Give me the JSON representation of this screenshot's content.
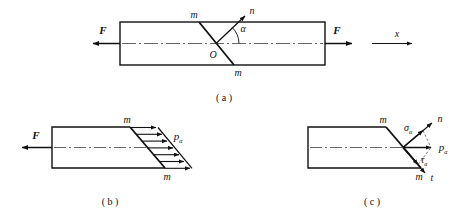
{
  "figure": {
    "title_caption_a": "( a )",
    "title_caption_b": "( b )",
    "title_caption_c": "( c )",
    "colors": {
      "stroke": "#111111",
      "background": "#ffffff",
      "centerline": "#444444"
    },
    "panel_a": {
      "name": "axially-loaded-bar-with-inclined-section",
      "force_left_label": "F",
      "force_right_label": "F",
      "axis_label": "x",
      "section_label_top": "m",
      "section_label_bottom": "m",
      "normal_label": "n",
      "angle_label": "α",
      "origin_label": "O",
      "bar": {
        "x": 120,
        "y": 22,
        "width": 205,
        "height": 43
      },
      "inclined_cut": {
        "x1": 199,
        "y1": 22,
        "x2": 234,
        "y2": 65
      },
      "normal_vector": {
        "x1": 216,
        "y1": 43,
        "x2": 247,
        "y2": 14
      },
      "angle_degrees": 45
    },
    "panel_b": {
      "name": "free-body-with-uniform-stress-distribution",
      "force_label": "F",
      "section_label_top": "m",
      "section_label_bottom": "m",
      "stress_label": "p",
      "stress_sub": "α",
      "arrow_count": 7,
      "block": {
        "x": 52,
        "y": 127,
        "width": 78,
        "height": 41
      },
      "inclined_cut": {
        "x1": 130,
        "y1": 127,
        "x2": 165,
        "y2": 168
      }
    },
    "panel_c": {
      "name": "stress-decomposition-normal-and-shear",
      "section_label_top": "m",
      "section_label_bottom": "m",
      "normal_axis_label": "n",
      "tangent_axis_label": "t",
      "normal_stress_label": "σ",
      "normal_stress_sub": "α",
      "total_stress_label": "p",
      "total_stress_sub": "α",
      "shear_stress_label": "τ",
      "shear_stress_sub": "α",
      "block": {
        "x": 308,
        "y": 127,
        "width": 78,
        "height": 41
      },
      "inclined_cut": {
        "x1": 386,
        "y1": 127,
        "x2": 421,
        "y2": 168
      }
    }
  }
}
